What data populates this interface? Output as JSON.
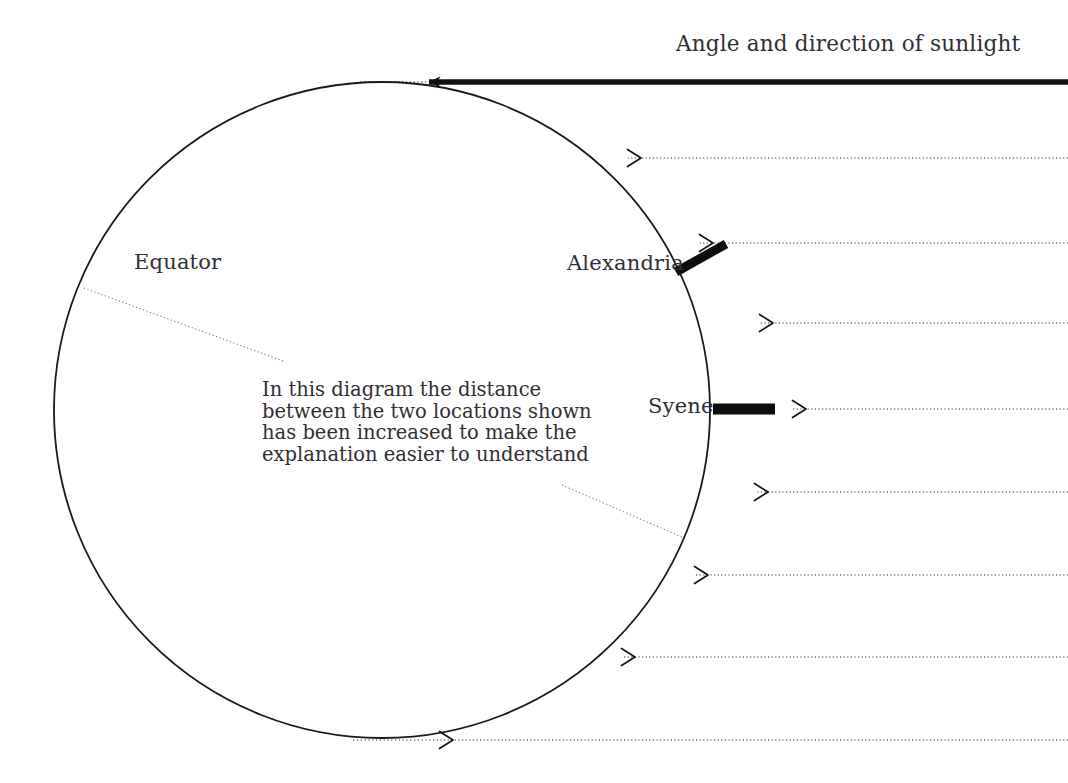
{
  "diagram": {
    "title": "Angle and direction of sunlight",
    "background_color": "#ffffff",
    "ink_color": "#1a1a1a",
    "text_color": "#302f33",
    "labels": {
      "equator": "Equator",
      "alexandria": "Alexandria",
      "syene": "Syene"
    },
    "caption": {
      "line1": "In this diagram the distance",
      "line2": "between the two locations shown",
      "line3": "has been increased to make the",
      "line4": "explanation easier to understand"
    },
    "earth": {
      "center_x": 382,
      "center_y": 410,
      "radius": 328,
      "stroke_width": 1.8
    },
    "sun_rays": {
      "count": 9,
      "direction": "right-to-left",
      "right_edge_x": 1068,
      "y_positions": [
        82,
        158,
        243,
        323,
        409,
        492,
        575,
        657,
        740
      ],
      "solid_ray_index": 0,
      "solid_ray_width": 5.5,
      "dotted_ray_width": 1.1,
      "dotted_pattern": "1.2 2.4"
    },
    "markers": {
      "alexandria_gnomon": {
        "x1": 676,
        "y1": 272,
        "x2": 726,
        "y2": 244,
        "width": 9
      },
      "syene_gnomon": {
        "x1": 713,
        "y1": 409,
        "x2": 775,
        "y2": 409,
        "width": 11
      }
    },
    "leader_lines": {
      "equator": {
        "x1": 84,
        "y1": 288,
        "x2": 283,
        "y2": 361
      },
      "caption": {
        "x1": 562,
        "y1": 485,
        "x2": 684,
        "y2": 538
      }
    }
  }
}
